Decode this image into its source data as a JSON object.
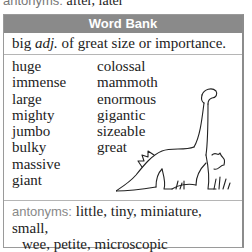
{
  "top_line": {
    "label": "antonyms:",
    "value": " after, later"
  },
  "word_bank": {
    "title": "Word Bank",
    "headword": "big",
    "part_of_speech": "adj.",
    "definition": "of great size or importance.",
    "synonyms_col1": [
      "huge",
      "immense",
      "large",
      "mighty",
      "jumbo",
      "bulky",
      "massive",
      "giant"
    ],
    "synonyms_col2": [
      "colossal",
      "mammoth",
      "enormous",
      "gigantic",
      "sizeable",
      "great"
    ],
    "illustration": "dinosaur-illustration",
    "antonyms_label": "antonyms:",
    "antonyms_line1": " little, tiny, miniature, small,",
    "antonyms_line2": "wee, petite, microscopic"
  },
  "colors": {
    "header_bg": "#8a8a8a",
    "header_text": "#ffffff",
    "label_gray": "#888888",
    "border": "#9a9a9a"
  }
}
